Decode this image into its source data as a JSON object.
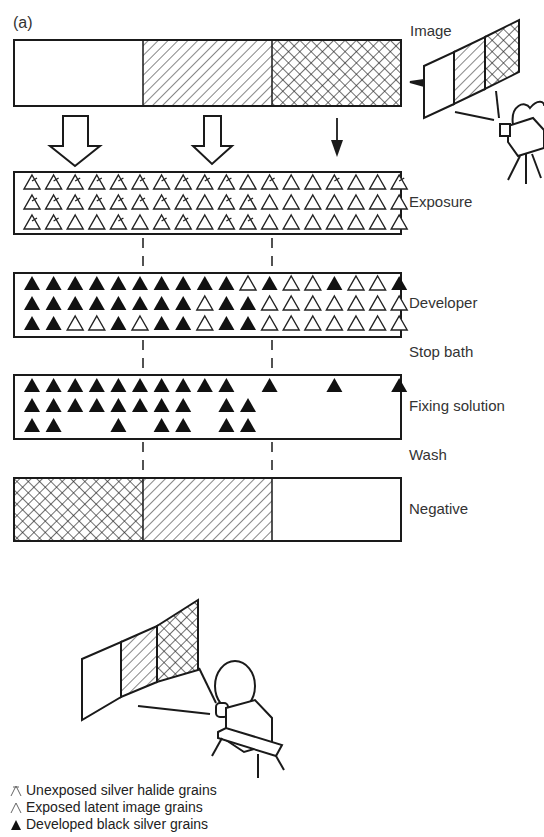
{
  "figure": {
    "panel_label": "(a)",
    "stages": [
      {
        "id": "image",
        "label": "Image"
      },
      {
        "id": "exposure",
        "label": "Exposure"
      },
      {
        "id": "developer",
        "label": "Developer"
      },
      {
        "id": "stop_bath",
        "label": "Stop bath"
      },
      {
        "id": "fixing",
        "label": "Fixing solution"
      },
      {
        "id": "wash",
        "label": "Wash"
      },
      {
        "id": "negative",
        "label": "Negative"
      }
    ],
    "image_bar": [
      "white",
      "hatched",
      "crosshatched"
    ],
    "negative_bar": [
      "crosshatched",
      "hatched",
      "white"
    ],
    "grains": {
      "legend_key": {
        "U": "unexposed",
        "E": "exposed-latent",
        "D": "developed",
        "_": "removed"
      },
      "exposure": [
        "UUUUUUUUUUEUEEUEEU",
        "UUUUUUUUEUUEEEEEEE",
        "UUEEUEUUEUUEEEEEEE"
      ],
      "developer": [
        "DDDDDDDDDDEDEEDEED",
        "DDDDDDDDEDDEEEEEEE",
        "DDEEDEDDEDDEEEEEEE"
      ],
      "fixing": [
        "DDDDDDDDDD_D__D__D",
        "DDDDDDDD_DD_______",
        "DD__D_DD_DD_______"
      ]
    }
  },
  "legend": {
    "items": [
      {
        "symbol": "unexposed",
        "text": "Unexposed silver halide grains"
      },
      {
        "symbol": "exposed",
        "text": "Exposed latent image grains"
      },
      {
        "symbol": "developed",
        "text": "Developed black silver grains"
      }
    ]
  }
}
